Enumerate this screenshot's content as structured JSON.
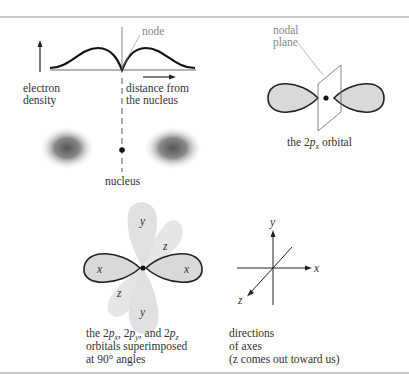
{
  "panels": {
    "density_plot": {
      "labels": {
        "node": "node",
        "y_axis_line1": "electron",
        "y_axis_line2": "density",
        "x_axis_line1": "distance from",
        "x_axis_line2": "the nucleus",
        "nucleus": "nucleus"
      }
    },
    "p_x_orbital": {
      "labels": {
        "nodal_line1": "nodal",
        "nodal_line2": "plane",
        "caption_pre": "the 2",
        "caption_p": "p",
        "caption_sub": "x",
        "caption_post": " orbital"
      }
    },
    "superimposed": {
      "lobe_labels": {
        "x_left": "x",
        "x_right": "x",
        "y_top": "y",
        "y_bottom": "y",
        "z_top": "z",
        "z_bottom": "z"
      },
      "caption_line1_parts": [
        "the 2",
        "p",
        "x",
        ", 2",
        "p",
        "y",
        ", and 2",
        "p",
        "z"
      ],
      "caption_line2": "orbitals superimposed",
      "caption_line3": "at 90° angles"
    },
    "axes": {
      "labels": {
        "x": "x",
        "y": "y",
        "z": "z"
      },
      "caption_line1": "directions",
      "caption_line2": "of axes",
      "caption_line3": "(z comes out toward us)"
    }
  },
  "colors": {
    "lobe_fill": "#d9d9d9",
    "lobe_light": "#e6e6e6",
    "outline": "#222222",
    "rule": "#c8c8c8",
    "gray_label": "#888888"
  }
}
